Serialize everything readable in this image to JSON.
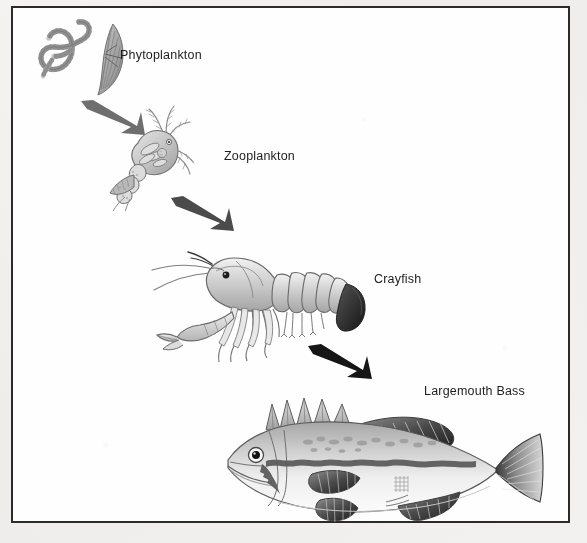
{
  "diagram": {
    "type": "food-chain",
    "background_color": "#fefefe",
    "page_color": "#f2f1ef",
    "frame_color": "#2b2b2b",
    "flow_direction": "top-left to bottom-right",
    "levels": [
      {
        "order": 1,
        "label": "Phytoplankton",
        "role": "producer",
        "label_position": {
          "x": 120,
          "y": 48
        }
      },
      {
        "order": 2,
        "label": "Zooplankton",
        "role": "primary-consumer",
        "label_position": {
          "x": 224,
          "y": 149
        }
      },
      {
        "order": 3,
        "label": "Crayfish",
        "role": "secondary-consumer",
        "label_position": {
          "x": 374,
          "y": 272
        }
      },
      {
        "order": 4,
        "label": "Largemouth Bass",
        "role": "tertiary-consumer",
        "label_position": {
          "x": 424,
          "y": 384
        }
      }
    ],
    "arrows": [
      {
        "from": "Phytoplankton",
        "to": "Zooplankton",
        "color": "#6e6e6e",
        "direction": "down-right"
      },
      {
        "from": "Zooplankton",
        "to": "Crayfish",
        "color": "#4b4b4b",
        "direction": "down-right"
      },
      {
        "from": "Crayfish",
        "to": "Largemouth Bass",
        "color": "#1a1a1a",
        "direction": "down-right"
      }
    ],
    "icons": {
      "phytoplankton": "filamentous-algae-and-diatom-icon",
      "zooplankton": "copepod-icon",
      "crayfish": "crayfish-icon",
      "bass": "largemouth-bass-icon"
    }
  }
}
